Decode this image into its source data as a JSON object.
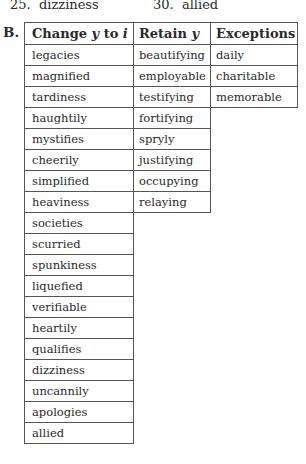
{
  "previous_answers": [
    {
      "number": "25.",
      "word": "dizziness"
    },
    {
      "number": "30.",
      "word": "allied"
    }
  ],
  "section": {
    "label": "B.",
    "headers": [
      {
        "text": "Change ",
        "var1": "y",
        "mid": " to ",
        "var2": "i"
      },
      {
        "text": "Retain ",
        "var1": "y"
      },
      {
        "text": "Exceptions"
      }
    ],
    "columns": {
      "change_y_to_i": [
        "legacies",
        "magnified",
        "tardiness",
        "haughtily",
        "mystifies",
        "cheerily",
        "simplified",
        "heaviness",
        "societies",
        "scurried",
        "spunkiness",
        "liquefied",
        "verifiable",
        "heartily",
        "qualifies",
        "dizziness",
        "uncannily",
        "apologies",
        "allied"
      ],
      "retain_y": [
        "beautifying",
        "employable",
        "testifying",
        "fortifying",
        "spryly",
        "justifying",
        "occupying",
        "relaying"
      ],
      "exceptions": [
        "daily",
        "charitable",
        "memorable"
      ]
    }
  }
}
